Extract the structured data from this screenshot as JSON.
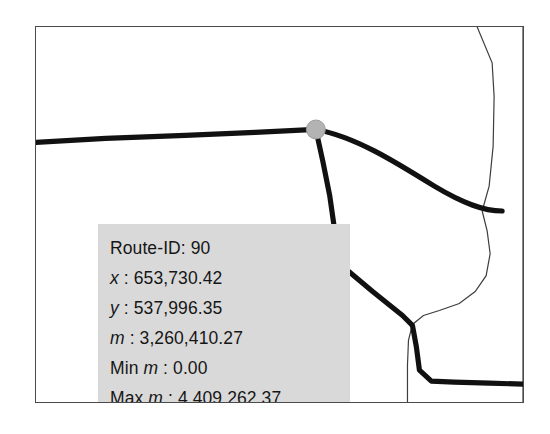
{
  "map": {
    "frame_label": "map-extent-frame",
    "background_color": "#ffffff",
    "border_color": "#4a4a4a",
    "selected_vertex": {
      "name": "route-vertex-marker",
      "fill_color": "#b3b3b3",
      "stroke_color": "#8c8c8c"
    },
    "road_color": "#111111",
    "boundary_color": "#3d3d3d"
  },
  "info_panel": {
    "background_color": "#d9d9d9",
    "text_color": "#161616",
    "rows": [
      {
        "label": "Route-ID",
        "symbol": "",
        "label_tail": "",
        "value": "90"
      },
      {
        "label": "",
        "symbol": "x",
        "label_tail": "",
        "value": "653,730.42"
      },
      {
        "label": "",
        "symbol": "y",
        "label_tail": "",
        "value": "537,996.35"
      },
      {
        "label": "",
        "symbol": "m",
        "label_tail": "",
        "value": "3,260,410.27"
      },
      {
        "label": "Min ",
        "symbol": "m",
        "label_tail": "",
        "value": "0.00"
      },
      {
        "label": "Max ",
        "symbol": "m",
        "label_tail": "",
        "value": "4,409,262.37"
      }
    ],
    "separator": " : ",
    "route_id_separator": ": ",
    "lines": [
      "Route-ID: 90",
      "x : 653,730.42",
      "y : 537,996.35",
      "m : 3,260,410.27",
      "Min m : 0.00",
      "Max m : 4,409,262.37"
    ],
    "route_id_label": "Route-ID",
    "route_id_value": "90",
    "x_symbol": "x",
    "x_value": "653,730.42",
    "y_symbol": "y",
    "y_value": "537,996.35",
    "m_symbol": "m",
    "m_value": "3,260,410.27",
    "min_prefix": "Min ",
    "min_symbol": "m",
    "min_value": "0.00",
    "max_prefix": "Max ",
    "max_symbol": "m",
    "max_value": "4,409,262.37"
  }
}
